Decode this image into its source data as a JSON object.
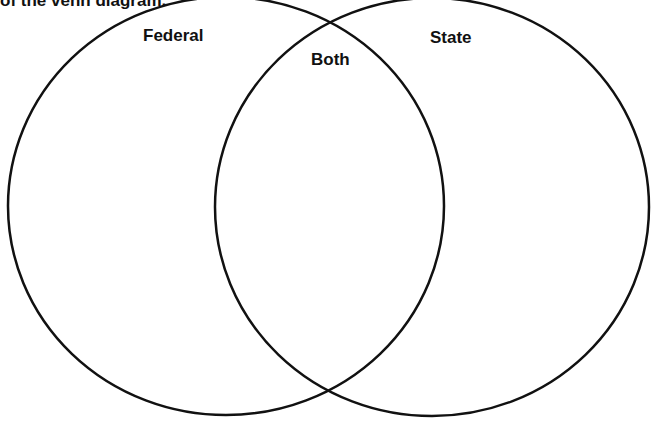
{
  "instruction": "of the venn diagram.",
  "venn": {
    "stroke_color": "#111111",
    "sets": [
      {
        "label": "Federal",
        "cx": 226,
        "cy": 206,
        "rx": 218,
        "ry": 209
      },
      {
        "label": "State",
        "cx": 432,
        "cy": 207,
        "rx": 217,
        "ry": 209
      }
    ],
    "intersection_label": "Both"
  }
}
